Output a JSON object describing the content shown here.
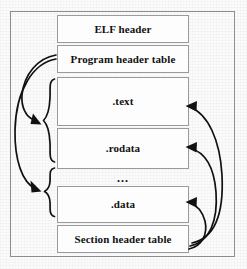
{
  "figure": {
    "type": "diagram",
    "background_color": "#fbfbfb",
    "line_color": "#111111",
    "box_border_color": "#9a9a9a",
    "frame_color": "#8d8d8d"
  },
  "segments": [
    {
      "label": "ELF header",
      "name": "elf-header"
    },
    {
      "label": "Program header table",
      "name": "program-header-table"
    },
    {
      "label": ".text",
      "name": "text-section"
    },
    {
      "label": ".rodata",
      "name": "rodata-section"
    },
    {
      "label": "...",
      "name": "sections-ellipsis"
    },
    {
      "label": ".data",
      "name": "data-section"
    },
    {
      "label": "Section header table",
      "name": "section-header-table"
    }
  ],
  "braces": [
    {
      "name": "brace-upper",
      "spans": [
        ".text",
        ".rodata"
      ]
    },
    {
      "name": "brace-lower",
      "spans": [
        "...",
        ".data"
      ]
    }
  ],
  "arrows": {
    "from_program_header_table": [
      {
        "name": "arrow-phdr-to-upper-brace",
        "target": "brace-upper"
      },
      {
        "name": "arrow-phdr-to-lower-brace",
        "target": "brace-lower"
      }
    ],
    "from_section_header_table": [
      {
        "name": "arrow-shdr-to-text",
        "target": ".text"
      },
      {
        "name": "arrow-shdr-to-rodata",
        "target": ".rodata"
      },
      {
        "name": "arrow-shdr-to-data",
        "target": ".data"
      }
    ]
  }
}
